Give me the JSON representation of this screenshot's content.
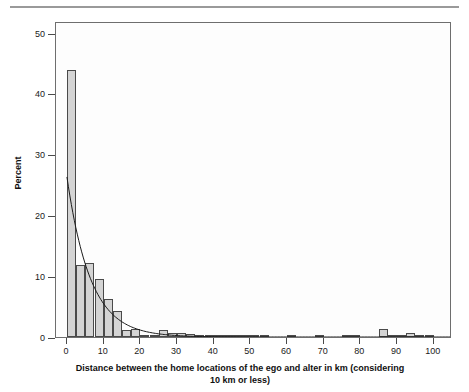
{
  "figure": {
    "rule_present": true,
    "background": "#ffffff",
    "bar_fill": "#d4d4d4",
    "bar_stroke": "#4a4a4a",
    "frame_stroke": "#6e6e6e"
  },
  "chart_data": {
    "type": "bar",
    "title": "",
    "subtitle": "",
    "xlabel": "Distance between the home locations of the ego and alter in km (considering 10 km or less)",
    "xlabel_line1": "Distance between the home locations of the ego and alter in km (considering",
    "xlabel_line2": "10 km or less)",
    "ylabel": "Percent",
    "xlim": [
      -3,
      105
    ],
    "ylim": [
      0,
      52
    ],
    "grid": false,
    "legend": null,
    "xticks": [
      0,
      10,
      20,
      30,
      40,
      50,
      60,
      70,
      80,
      90,
      100
    ],
    "xtick_labels": [
      "0",
      "10",
      "20",
      "30",
      "40",
      "50",
      "60",
      "70",
      "80",
      "90",
      "100"
    ],
    "yticks": [
      0,
      10,
      20,
      30,
      40,
      50
    ],
    "ytick_labels": [
      "0",
      "10",
      "20",
      "30",
      "40",
      "50"
    ],
    "bin_width": 2.5,
    "bin_starts": [
      0,
      2.5,
      5,
      7.5,
      10,
      12.5,
      15,
      17.5,
      20,
      22.5,
      25,
      27.5,
      30,
      32.5,
      35,
      37.5,
      40,
      42.5,
      45,
      47.5,
      50,
      52.5,
      55,
      57.5,
      60,
      62.5,
      65,
      67.5,
      70,
      72.5,
      75,
      77.5,
      80,
      82.5,
      85,
      87.5,
      90,
      92.5,
      95,
      97.5,
      100
    ],
    "categories": [
      "0-2.5",
      "2.5-5",
      "5-7.5",
      "7.5-10",
      "10-12.5",
      "12.5-15",
      "15-17.5",
      "17.5-20",
      "20-22.5",
      "22.5-25",
      "25-27.5",
      "27.5-30",
      "30-32.5",
      "32.5-35",
      "35-37.5",
      "37.5-40",
      "40-42.5",
      "42.5-45",
      "45-47.5",
      "47.5-50",
      "50-52.5",
      "52.5-55",
      "55-57.5",
      "57.5-60",
      "60-62.5",
      "62.5-65",
      "65-67.5",
      "67.5-70",
      "70-72.5",
      "72.5-75",
      "75-77.5",
      "77.5-80",
      "80-82.5",
      "82.5-85",
      "85-87.5",
      "87.5-90",
      "90-92.5",
      "92.5-95",
      "95-97.5",
      "97.5-100",
      "100-102.5"
    ],
    "values": [
      44.0,
      11.8,
      12.2,
      9.5,
      6.2,
      4.2,
      1.2,
      1.3,
      0.3,
      0.2,
      1.1,
      0.6,
      0.7,
      0.5,
      0.2,
      0.15,
      0.1,
      0.3,
      0.1,
      0.05,
      0.05,
      0.05,
      0.0,
      0.0,
      0.25,
      0.0,
      0.0,
      0.05,
      0.0,
      0.0,
      0.1,
      0.05,
      0.0,
      0.0,
      1.3,
      0.15,
      0.05,
      0.7,
      0.3,
      0.1,
      0.0
    ],
    "overlay": {
      "name": "exponential fit curve",
      "type": "line",
      "color": "#1a1a1a",
      "amplitude": 26.5,
      "decay_km": 6.4,
      "x_start": 0,
      "x_end": 105
    }
  }
}
